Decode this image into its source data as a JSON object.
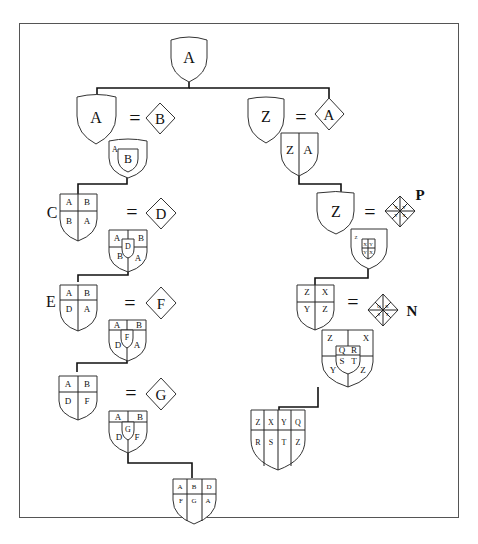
{
  "diagram": {
    "type": "heraldic-quartering-tree",
    "root": {
      "shield": "A"
    },
    "left_branch": {
      "steps": [
        {
          "label": "",
          "shield": [
            "A"
          ],
          "equals": "=",
          "lozenge": "B",
          "result": {
            "outer": "A",
            "inescutcheon": "B"
          }
        },
        {
          "label": "C",
          "shield": [
            "A",
            "B",
            "B",
            "A"
          ],
          "equals": "=",
          "lozenge": "D",
          "result": {
            "quarters": [
              "A",
              "B",
              "B",
              "A"
            ],
            "inescutcheon": "D"
          }
        },
        {
          "label": "E",
          "shield": [
            "A",
            "B",
            "D",
            "A"
          ],
          "equals": "=",
          "lozenge": "F",
          "result": {
            "quarters": [
              "A",
              "B",
              "D",
              "A"
            ],
            "inescutcheon": "F"
          }
        },
        {
          "label": "",
          "shield": [
            "A",
            "B",
            "D",
            "F"
          ],
          "equals": "=",
          "lozenge": "G",
          "result": {
            "quarters": [
              "A",
              "B",
              "D",
              "F"
            ],
            "inescutcheon": "G"
          }
        }
      ],
      "final": {
        "grid": [
          "A",
          "B",
          "D",
          "F",
          "G",
          "A"
        ]
      }
    },
    "right_branch": {
      "steps": [
        {
          "label": "",
          "shield": [
            "Z"
          ],
          "equals": "=",
          "lozenge": "A",
          "result": {
            "impaled": [
              "Z",
              "A"
            ]
          }
        },
        {
          "label": "",
          "shield": [
            "Z"
          ],
          "equals": "=",
          "lozenge_quarters": [
            "X",
            "Y",
            "Y",
            "X"
          ],
          "lozenge_label": "P",
          "result": {
            "outer": "Z",
            "inescutcheon_quarters": [
              "X",
              "Y",
              "Y",
              "X"
            ]
          }
        },
        {
          "label": "",
          "shield": [
            "Z",
            "X",
            "Y",
            "Z"
          ],
          "equals": "=",
          "lozenge_quarters": [
            "Q",
            "R",
            "S",
            "T"
          ],
          "lozenge_label": "N",
          "result": {
            "quarters": [
              "Z",
              "X",
              "Y",
              "Z"
            ],
            "inescutcheon_quarters": [
              "Q",
              "R",
              "S",
              "T"
            ]
          }
        }
      ],
      "final": {
        "grid": [
          "Z",
          "X",
          "Y",
          "Q",
          "R",
          "S",
          "T",
          "Z"
        ]
      }
    }
  }
}
